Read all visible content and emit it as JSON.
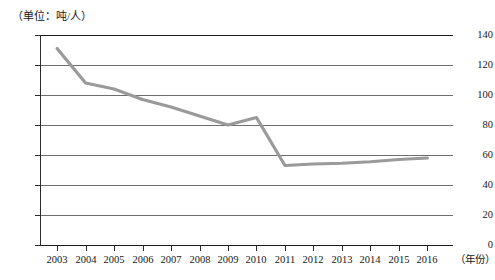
{
  "chart_data": {
    "type": "line",
    "title": "",
    "unit_label": "（单位：吨/人）",
    "xlabel": "（年份）",
    "ylabel": "",
    "categories": [
      "2003",
      "2004",
      "2005",
      "2006",
      "2007",
      "2008",
      "2009",
      "2010",
      "2011",
      "2012",
      "2013",
      "2014",
      "2015",
      "2016"
    ],
    "values": [
      131,
      108,
      104,
      97,
      92,
      86,
      80,
      85,
      53,
      54,
      54.5,
      55.5,
      57,
      58
    ],
    "series": [
      {
        "name": "吨/人",
        "values": [
          131,
          108,
          104,
          97,
          92,
          86,
          80,
          85,
          53,
          54,
          54.5,
          55.5,
          57,
          58
        ]
      }
    ],
    "ylim": [
      0,
      140
    ],
    "ytick_values": [
      0,
      20,
      40,
      60,
      80,
      100,
      120,
      140
    ],
    "ytick_labels": [
      "0",
      "20",
      "40",
      "60",
      "80",
      "100",
      "120",
      "140"
    ],
    "grid": true,
    "legend": "none",
    "line_color": "#9a9a9a",
    "grid_color": "#6e6e6e",
    "axis_color": "#1d1d1d"
  }
}
